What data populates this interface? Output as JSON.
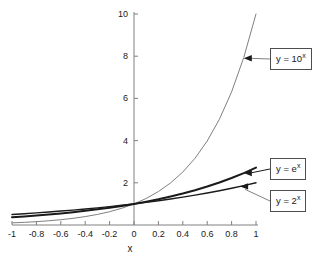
{
  "chart_data": {
    "type": "line",
    "title": "",
    "xlabel": "x",
    "ylabel": "",
    "xlim": [
      -1,
      1
    ],
    "ylim": [
      0,
      10
    ],
    "grid": false,
    "legend_position": "annotations-right",
    "x_ticks": [
      "-1",
      "-0.8",
      "-0.6",
      "-0.4",
      "-0.2",
      "0",
      "0.2",
      "0.4",
      "0.6",
      "0.8",
      "1"
    ],
    "x_tick_values": [
      -1,
      -0.8,
      -0.6,
      -0.4,
      -0.2,
      0,
      0.2,
      0.4,
      0.6,
      0.8,
      1
    ],
    "y_ticks": [
      "2",
      "4",
      "6",
      "8",
      "10"
    ],
    "y_tick_values": [
      2,
      4,
      6,
      8,
      10
    ],
    "x": [
      -1,
      -0.9,
      -0.8,
      -0.7,
      -0.6,
      -0.5,
      -0.4,
      -0.3,
      -0.2,
      -0.1,
      0,
      0.1,
      0.2,
      0.3,
      0.4,
      0.5,
      0.6,
      0.7,
      0.8,
      0.9,
      1
    ],
    "series": [
      {
        "name": "y = 10^x",
        "label": "y = 10",
        "exponent": "x",
        "color": "#808080",
        "width": 1,
        "values": [
          0.1,
          0.126,
          0.158,
          0.2,
          0.251,
          0.316,
          0.398,
          0.501,
          0.631,
          0.794,
          1,
          1.259,
          1.585,
          1.995,
          2.512,
          3.162,
          3.981,
          5.012,
          6.31,
          7.943,
          10
        ]
      },
      {
        "name": "y = e^x",
        "label": "y = e",
        "exponent": "x",
        "color": "#1a1a1a",
        "width": 2,
        "values": [
          0.368,
          0.407,
          0.449,
          0.497,
          0.549,
          0.607,
          0.67,
          0.741,
          0.819,
          0.905,
          1,
          1.105,
          1.221,
          1.35,
          1.492,
          1.649,
          1.822,
          2.014,
          2.226,
          2.46,
          2.718
        ]
      },
      {
        "name": "y = 2^x",
        "label": "y = 2",
        "exponent": "x",
        "color": "#1a1a1a",
        "width": 1.4,
        "values": [
          0.5,
          0.536,
          0.574,
          0.616,
          0.66,
          0.707,
          0.758,
          0.812,
          0.871,
          0.933,
          1,
          1.072,
          1.149,
          1.231,
          1.32,
          1.414,
          1.516,
          1.625,
          1.741,
          1.866,
          2
        ]
      }
    ],
    "annotations": [
      {
        "text_prefix": "y = 10",
        "exponent": "x",
        "target_x": 0.9,
        "target_y": 7.9
      },
      {
        "text_prefix": "y = e",
        "exponent": "x",
        "target_x": 0.9,
        "target_y": 2.46
      },
      {
        "text_prefix": "y = 2",
        "exponent": "x",
        "target_x": 0.87,
        "target_y": 1.83
      }
    ]
  },
  "axes": {
    "x_title": "x"
  }
}
